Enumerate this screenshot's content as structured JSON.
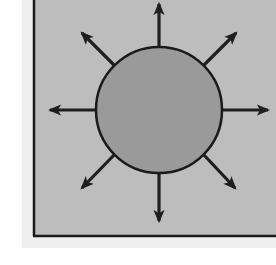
{
  "diagram": {
    "colors": {
      "box_fill": "#bdbdbd",
      "box_border": "#1a1a1a",
      "circle_fill": "#9a9a9a",
      "circle_stroke": "#1a1a1a",
      "arrow": "#1e1e1e",
      "background": "#ffffff"
    },
    "circle": {
      "cx": 159,
      "cy": 110,
      "r": 63
    },
    "arrows": [
      {
        "name": "arrow-up",
        "direction": "N"
      },
      {
        "name": "arrow-up-right",
        "direction": "NE"
      },
      {
        "name": "arrow-right",
        "direction": "E"
      },
      {
        "name": "arrow-down-right",
        "direction": "SE"
      },
      {
        "name": "arrow-down",
        "direction": "S"
      },
      {
        "name": "arrow-down-left",
        "direction": "SW"
      },
      {
        "name": "arrow-left",
        "direction": "W"
      },
      {
        "name": "arrow-up-left",
        "direction": "NW"
      }
    ]
  }
}
